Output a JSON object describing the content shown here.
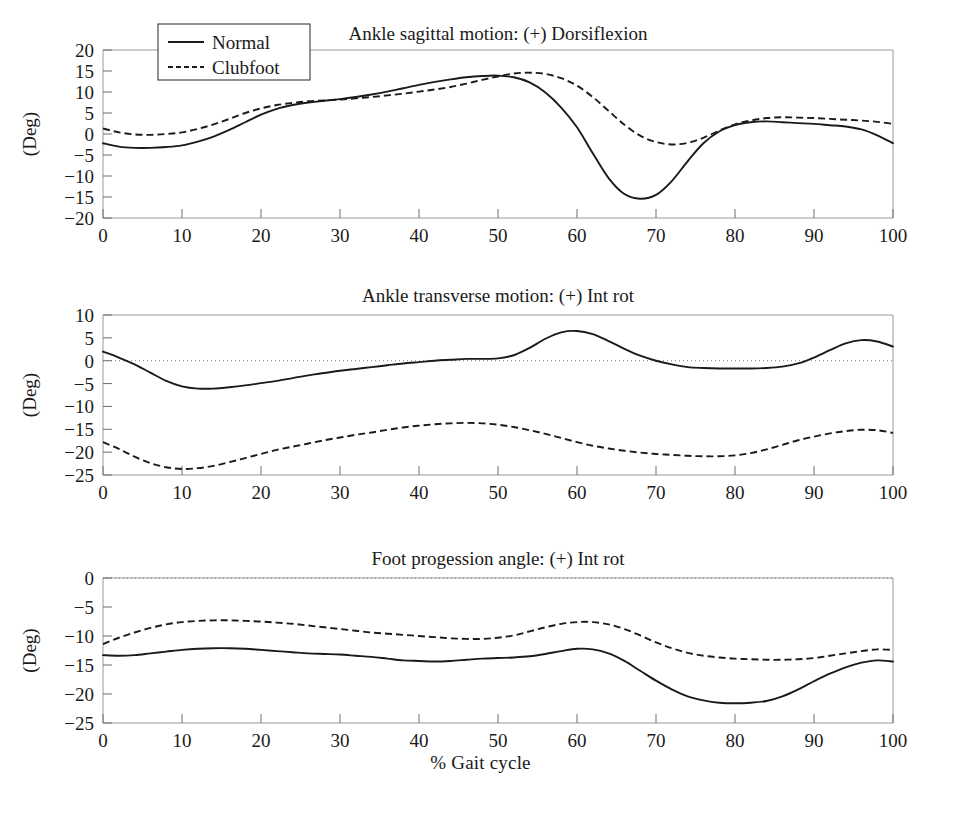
{
  "figure": {
    "xlabel": "% Gait cycle",
    "ylabel": "(Deg)",
    "legend": {
      "position": "top-left",
      "entries": [
        {
          "label": "Normal",
          "style": "solid"
        },
        {
          "label": "Clubfoot",
          "style": "dashed"
        }
      ]
    }
  },
  "chart_data": [
    {
      "type": "line",
      "title": "Ankle sagittal motion: (+) Dorsiflexion",
      "xlabel": "% Gait cycle",
      "ylabel": "(Deg)",
      "xlim": [
        0,
        100
      ],
      "ylim": [
        -20,
        20
      ],
      "xticks": [
        0,
        10,
        20,
        30,
        40,
        50,
        60,
        70,
        80,
        90,
        100
      ],
      "yticks": [
        20,
        15,
        10,
        5,
        0,
        -5,
        -10,
        -15,
        -20
      ],
      "grid": false,
      "zero_reference_line": false,
      "x": [
        0,
        2,
        4,
        6,
        8,
        10,
        12,
        14,
        16,
        18,
        20,
        22,
        24,
        26,
        28,
        30,
        32,
        34,
        36,
        38,
        40,
        42,
        44,
        46,
        48,
        50,
        52,
        54,
        56,
        58,
        60,
        62,
        64,
        66,
        68,
        70,
        72,
        74,
        76,
        78,
        80,
        82,
        84,
        86,
        88,
        90,
        92,
        94,
        96,
        98,
        100
      ],
      "series": [
        {
          "name": "Normal",
          "style": "solid",
          "values": [
            -2.2,
            -3.0,
            -3.3,
            -3.3,
            -3.1,
            -2.7,
            -1.8,
            -0.6,
            1.0,
            2.8,
            4.6,
            6.0,
            6.9,
            7.5,
            7.9,
            8.3,
            8.8,
            9.4,
            10.1,
            10.9,
            11.7,
            12.4,
            13.0,
            13.5,
            13.8,
            13.9,
            13.5,
            12.3,
            9.9,
            6.3,
            1.6,
            -4.6,
            -10.5,
            -14.3,
            -15.4,
            -14.5,
            -11.2,
            -6.5,
            -2.2,
            0.6,
            2.1,
            2.8,
            3.0,
            2.8,
            2.6,
            2.4,
            2.1,
            1.8,
            1.1,
            -0.3,
            -2.2
          ]
        },
        {
          "name": "Clubfoot",
          "style": "dashed",
          "values": [
            1.3,
            0.4,
            -0.1,
            -0.2,
            0.0,
            0.4,
            1.2,
            2.3,
            3.6,
            5.0,
            6.1,
            6.9,
            7.4,
            7.8,
            8.0,
            8.2,
            8.5,
            8.8,
            9.2,
            9.6,
            10.1,
            10.6,
            11.2,
            12.0,
            12.9,
            13.7,
            14.4,
            14.6,
            14.3,
            13.3,
            11.5,
            8.8,
            5.5,
            2.2,
            -0.4,
            -1.9,
            -2.5,
            -2.1,
            -0.9,
            0.8,
            2.3,
            3.2,
            3.8,
            4.0,
            3.9,
            3.8,
            3.6,
            3.4,
            3.2,
            2.9,
            2.4
          ]
        }
      ]
    },
    {
      "type": "line",
      "title": "Ankle transverse motion: (+) Int rot",
      "xlabel": "% Gait cycle",
      "ylabel": "(Deg)",
      "xlim": [
        0,
        100
      ],
      "ylim": [
        -25,
        10
      ],
      "xticks": [
        0,
        10,
        20,
        30,
        40,
        50,
        60,
        70,
        80,
        90,
        100
      ],
      "yticks": [
        10,
        5,
        0,
        -5,
        -10,
        -15,
        -20,
        -25
      ],
      "grid": false,
      "zero_reference_line": true,
      "x": [
        0,
        2,
        4,
        6,
        8,
        10,
        12,
        14,
        16,
        18,
        20,
        22,
        24,
        26,
        28,
        30,
        32,
        34,
        36,
        38,
        40,
        42,
        44,
        46,
        48,
        50,
        52,
        54,
        56,
        58,
        60,
        62,
        64,
        66,
        68,
        70,
        72,
        74,
        76,
        78,
        80,
        82,
        84,
        86,
        88,
        90,
        92,
        94,
        96,
        98,
        100
      ],
      "series": [
        {
          "name": "Normal",
          "style": "solid",
          "values": [
            2.0,
            0.7,
            -0.8,
            -2.6,
            -4.4,
            -5.6,
            -6.1,
            -6.1,
            -5.8,
            -5.4,
            -4.9,
            -4.4,
            -3.8,
            -3.2,
            -2.7,
            -2.2,
            -1.8,
            -1.4,
            -1.0,
            -0.6,
            -0.3,
            0.0,
            0.2,
            0.4,
            0.4,
            0.5,
            1.2,
            2.8,
            4.8,
            6.2,
            6.5,
            5.8,
            4.3,
            2.6,
            1.1,
            0.0,
            -0.8,
            -1.4,
            -1.6,
            -1.7,
            -1.7,
            -1.7,
            -1.6,
            -1.3,
            -0.6,
            0.7,
            2.3,
            3.8,
            4.5,
            4.2,
            3.1
          ]
        },
        {
          "name": "Clubfoot",
          "style": "dashed",
          "values": [
            -17.8,
            -19.3,
            -21.0,
            -22.4,
            -23.3,
            -23.7,
            -23.5,
            -23.0,
            -22.2,
            -21.3,
            -20.4,
            -19.5,
            -18.8,
            -18.1,
            -17.4,
            -16.8,
            -16.2,
            -15.7,
            -15.1,
            -14.6,
            -14.2,
            -13.9,
            -13.7,
            -13.6,
            -13.7,
            -14.0,
            -14.5,
            -15.2,
            -16.0,
            -16.9,
            -17.8,
            -18.6,
            -19.2,
            -19.7,
            -20.1,
            -20.4,
            -20.6,
            -20.8,
            -20.9,
            -20.9,
            -20.7,
            -20.2,
            -19.4,
            -18.4,
            -17.4,
            -16.6,
            -15.9,
            -15.4,
            -15.1,
            -15.2,
            -15.8
          ]
        }
      ]
    },
    {
      "type": "line",
      "title": "Foot progession angle: (+) Int rot",
      "xlabel": "% Gait cycle",
      "ylabel": "(Deg)",
      "xlim": [
        0,
        100
      ],
      "ylim": [
        -25,
        0
      ],
      "xticks": [
        0,
        10,
        20,
        30,
        40,
        50,
        60,
        70,
        80,
        90,
        100
      ],
      "yticks": [
        0,
        -5,
        -10,
        -15,
        -20,
        -25
      ],
      "grid": false,
      "zero_reference_line": true,
      "x": [
        0,
        2,
        4,
        6,
        8,
        10,
        12,
        14,
        16,
        18,
        20,
        22,
        24,
        26,
        28,
        30,
        32,
        34,
        36,
        38,
        40,
        42,
        44,
        46,
        48,
        50,
        52,
        54,
        56,
        58,
        60,
        62,
        64,
        66,
        68,
        70,
        72,
        74,
        76,
        78,
        80,
        82,
        84,
        86,
        88,
        90,
        92,
        94,
        96,
        98,
        100
      ],
      "series": [
        {
          "name": "Normal",
          "style": "solid",
          "values": [
            -13.3,
            -13.4,
            -13.3,
            -13.0,
            -12.7,
            -12.4,
            -12.2,
            -12.1,
            -12.1,
            -12.2,
            -12.4,
            -12.6,
            -12.8,
            -13.0,
            -13.1,
            -13.2,
            -13.4,
            -13.6,
            -13.9,
            -14.2,
            -14.3,
            -14.4,
            -14.3,
            -14.1,
            -13.9,
            -13.8,
            -13.7,
            -13.5,
            -13.1,
            -12.6,
            -12.2,
            -12.3,
            -13.0,
            -14.3,
            -16.0,
            -17.7,
            -19.2,
            -20.4,
            -21.1,
            -21.5,
            -21.6,
            -21.5,
            -21.2,
            -20.4,
            -19.2,
            -17.8,
            -16.5,
            -15.4,
            -14.6,
            -14.2,
            -14.4
          ]
        },
        {
          "name": "Clubfoot",
          "style": "dashed",
          "values": [
            -11.4,
            -10.3,
            -9.4,
            -8.6,
            -8.0,
            -7.6,
            -7.4,
            -7.3,
            -7.3,
            -7.4,
            -7.5,
            -7.7,
            -7.9,
            -8.2,
            -8.5,
            -8.8,
            -9.1,
            -9.4,
            -9.6,
            -9.8,
            -10.0,
            -10.2,
            -10.4,
            -10.5,
            -10.5,
            -10.3,
            -9.9,
            -9.2,
            -8.5,
            -7.9,
            -7.6,
            -7.6,
            -8.0,
            -8.8,
            -9.9,
            -11.1,
            -12.1,
            -12.9,
            -13.4,
            -13.7,
            -13.9,
            -14.0,
            -14.1,
            -14.1,
            -14.0,
            -13.8,
            -13.4,
            -13.0,
            -12.6,
            -12.3,
            -12.4
          ]
        }
      ]
    }
  ]
}
